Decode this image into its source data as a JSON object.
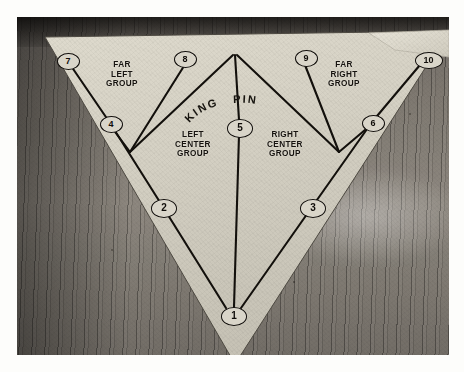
{
  "scene": {
    "kind": "photograph",
    "subject": "bowling-pin-placement-diagram",
    "surface": "wooden-bowling-lane",
    "paper_border_color": "#fdfdfb",
    "sheet_color": "#d7d3c6",
    "ink_color": "#16130f"
  },
  "diagram": {
    "kingpin_label": "KING  PIN",
    "groups": [
      {
        "id": "far-left",
        "label": "FAR\nLEFT\nGROUP",
        "pins": [
          7,
          4
        ]
      },
      {
        "id": "left-center",
        "label": "LEFT\nCENTER\nGROUP",
        "pins": [
          8,
          2
        ]
      },
      {
        "id": "right-center",
        "label": "RIGHT\nCENTER\nGROUP",
        "pins": [
          9,
          3
        ]
      },
      {
        "id": "far-right",
        "label": "FAR\nRIGHT\nGROUP",
        "pins": [
          10,
          6
        ]
      }
    ],
    "pins": [
      {
        "number": "1",
        "x": 216,
        "y": 298
      },
      {
        "number": "2",
        "x": 146,
        "y": 190
      },
      {
        "number": "3",
        "x": 295,
        "y": 190
      },
      {
        "number": "4",
        "x": 93,
        "y": 106
      },
      {
        "number": "5",
        "x": 222,
        "y": 110
      },
      {
        "number": "6",
        "x": 355,
        "y": 105
      },
      {
        "number": "7",
        "x": 50,
        "y": 43
      },
      {
        "number": "8",
        "x": 167,
        "y": 41
      },
      {
        "number": "9",
        "x": 288,
        "y": 40
      },
      {
        "number": "10",
        "x": 408,
        "y": 42
      }
    ]
  },
  "labels": {
    "far_left": "FAR\nLEFT\nGROUP",
    "far_right": "FAR\nRIGHT\nGROUP",
    "left_center": "LEFT\nCENTER\nGROUP",
    "right_center": "RIGHT\nCENTER\nGROUP",
    "king_word": "KING",
    "pin_word": "PIN"
  },
  "pin_numbers": {
    "p1": "1",
    "p2": "2",
    "p3": "3",
    "p4": "4",
    "p5": "5",
    "p6": "6",
    "p7": "7",
    "p8": "8",
    "p9": "9",
    "p10": "10"
  }
}
